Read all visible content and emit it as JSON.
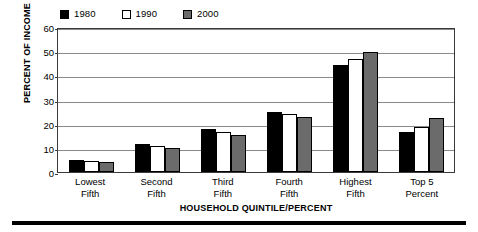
{
  "chart_data": {
    "type": "bar",
    "title": "",
    "xlabel": "HOUSEHOLD QUINTILE/PERCENT",
    "ylabel": "PERCENT OF INCOME",
    "ylim": [
      0,
      60
    ],
    "yticks": [
      0,
      10,
      20,
      30,
      40,
      50,
      60
    ],
    "grid": true,
    "legend_position": "top-left",
    "categories": [
      "Lowest Fifth",
      "Second Fifth",
      "Third Fifth",
      "Fourth Fifth",
      "Highest Fifth",
      "Top 5 Percent"
    ],
    "category_lines": [
      [
        "Lowest",
        "Fifth"
      ],
      [
        "Second",
        "Fifth"
      ],
      [
        "Third",
        "Fifth"
      ],
      [
        "Fourth",
        "Fifth"
      ],
      [
        "Highest",
        "Fifth"
      ],
      [
        "Top 5",
        "Percent"
      ]
    ],
    "series": [
      {
        "name": "1980",
        "color": "#000000",
        "values": [
          5.1,
          11.6,
          17.6,
          24.9,
          44.1,
          16.5
        ]
      },
      {
        "name": "1990",
        "color": "#ffffff",
        "values": [
          4.6,
          10.8,
          16.6,
          23.8,
          46.6,
          18.6
        ]
      },
      {
        "name": "2000",
        "color": "#6b6b6b",
        "values": [
          4.3,
          9.8,
          15.4,
          22.7,
          49.7,
          22.4
        ]
      }
    ]
  },
  "legend": {
    "items": [
      {
        "label": "1980",
        "swatch": "#000000"
      },
      {
        "label": "1990",
        "swatch": "#ffffff"
      },
      {
        "label": "2000",
        "swatch": "#6b6b6b"
      }
    ]
  },
  "axes": {
    "y_title": "PERCENT OF INCOME",
    "x_title": "HOUSEHOLD QUINTILE/PERCENT",
    "y_ticks": [
      "0",
      "10",
      "20",
      "30",
      "40",
      "50",
      "60"
    ]
  }
}
